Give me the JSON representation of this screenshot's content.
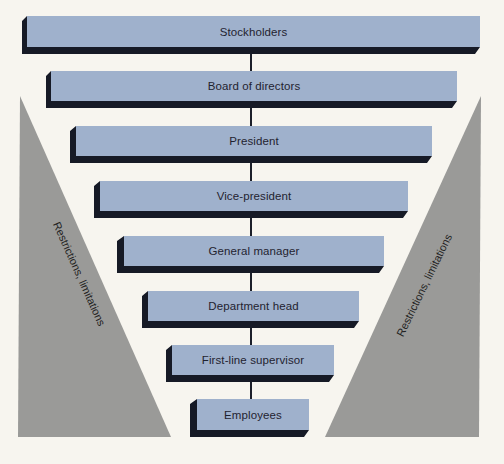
{
  "diagram": {
    "type": "organizational-hierarchy",
    "colors": {
      "background": "#f7f5ef",
      "box_face": "#9fb1cc",
      "box_shadow": "#161a26",
      "triangle": "#9a9a98",
      "connector": "#1c1f2a"
    },
    "levels": [
      {
        "label": "Stockholders"
      },
      {
        "label": "Board of directors"
      },
      {
        "label": "President"
      },
      {
        "label": "Vice-president"
      },
      {
        "label": "General manager"
      },
      {
        "label": "Department head"
      },
      {
        "label": "First-line supervisor"
      },
      {
        "label": "Employees"
      }
    ],
    "side_labels": {
      "left": "Restrictions, limitations",
      "right": "Restrictions, limitations"
    }
  }
}
